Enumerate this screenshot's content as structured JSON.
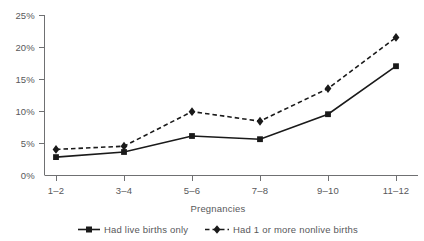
{
  "chart_data": {
    "type": "line",
    "title": "",
    "xlabel": "Pregnancies",
    "ylabel": "",
    "categories": [
      "1–2",
      "3–4",
      "5–6",
      "7–8",
      "9–10",
      "11–12"
    ],
    "ylim": [
      0,
      25
    ],
    "yticks": [
      "0%",
      "5%",
      "10%",
      "15%",
      "20%",
      "25%"
    ],
    "ytick_values": [
      0,
      5,
      10,
      15,
      20,
      25
    ],
    "grid": false,
    "legend_position": "bottom",
    "series": [
      {
        "name": "Had live births only",
        "values": [
          2.8,
          3.6,
          6.1,
          5.6,
          9.5,
          17.0
        ],
        "style": "solid",
        "marker": "square",
        "color": "#1a1a1a"
      },
      {
        "name": "Had 1 or more nonlive births",
        "values": [
          4.0,
          4.5,
          9.9,
          8.4,
          13.5,
          21.5
        ],
        "style": "dashed",
        "marker": "diamond",
        "color": "#1a1a1a"
      }
    ]
  },
  "legend": {
    "items": [
      {
        "label": "Had live births only"
      },
      {
        "label": "Had 1 or more nonlive births"
      }
    ]
  },
  "axes": {
    "x_title": "Pregnancies"
  }
}
